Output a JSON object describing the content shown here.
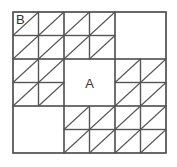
{
  "diagram": {
    "type": "grid-tiling",
    "grid": {
      "rows": 6,
      "cols": 6,
      "origin_x": 13,
      "origin_y": 12,
      "cell_w": 25.5,
      "cell_h": 23.5
    },
    "colors": {
      "line": "#555555",
      "background": "#ffffff",
      "label": "#333333"
    },
    "blank_blocks": [
      {
        "name": "top-right-block",
        "row": 0,
        "col": 4,
        "rows": 2,
        "cols": 2,
        "label": ""
      },
      {
        "name": "center-block-a",
        "row": 2,
        "col": 2,
        "rows": 2,
        "cols": 2,
        "label": "A"
      },
      {
        "name": "bottom-left-block",
        "row": 4,
        "col": 0,
        "rows": 2,
        "cols": 2,
        "label": ""
      }
    ],
    "cell_diagonal": "bottom-left-to-top-right",
    "labels": {
      "a": "A",
      "b": "B"
    },
    "label_b_cell": {
      "row": 0,
      "col": 0
    }
  }
}
